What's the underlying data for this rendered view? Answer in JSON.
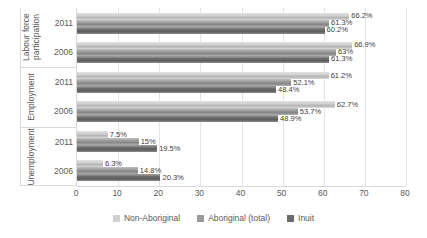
{
  "chart_data": {
    "type": "bar",
    "orientation": "horizontal",
    "title": "",
    "xlabel": "",
    "ylabel": "",
    "xlim": [
      0,
      80
    ],
    "xticks": [
      "0",
      "10",
      "20",
      "30",
      "40",
      "50",
      "60",
      "70",
      "80"
    ],
    "grid": "vertical-gridlines-on",
    "legend_position": "bottom",
    "axis_color": "#d9d9d9",
    "gridline_color": "#e4e4e4",
    "axis_text_color": "#595959",
    "data_label_color": "#404040",
    "series": [
      {
        "name": "Non-Aboriginal",
        "color": "#d0d0d0"
      },
      {
        "name": "Aboriginal (total)",
        "color": "#9b9b9b"
      },
      {
        "name": "Inuit",
        "color": "#6b6b6b"
      }
    ],
    "groups": [
      {
        "label": "Labour force participation",
        "rows": [
          {
            "year": "2011",
            "values": [
              66.2,
              61.3,
              60.2
            ],
            "labels": [
              "66.2%",
              "61.3%",
              "60.2%"
            ]
          },
          {
            "year": "2006",
            "values": [
              66.9,
              63,
              61.3
            ],
            "labels": [
              "66.9%",
              "63%",
              "61.3%"
            ]
          }
        ]
      },
      {
        "label": "Employment",
        "rows": [
          {
            "year": "2011",
            "values": [
              61.2,
              52.1,
              48.4
            ],
            "labels": [
              "61.2%",
              "52.1%",
              "48.4%"
            ]
          },
          {
            "year": "2006",
            "values": [
              62.7,
              53.7,
              48.9
            ],
            "labels": [
              "62.7%",
              "53.7%",
              "48.9%"
            ]
          }
        ]
      },
      {
        "label": "Unemployment",
        "rows": [
          {
            "year": "2011",
            "values": [
              7.5,
              15,
              19.5
            ],
            "labels": [
              "7.5%",
              "15%",
              "19.5%"
            ]
          },
          {
            "year": "2006",
            "values": [
              6.3,
              14.8,
              20.3
            ],
            "labels": [
              "6.3%",
              "14.8%",
              "20.3%"
            ]
          }
        ]
      }
    ]
  }
}
